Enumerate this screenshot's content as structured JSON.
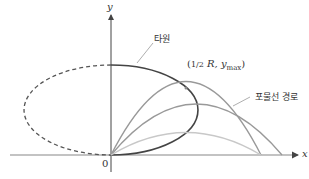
{
  "labels": {
    "y_axis": "y",
    "x_axis": "x",
    "origin": "0",
    "ellipse": "타원",
    "parabola": "포물선 경로",
    "point_frac": "1/2",
    "point_R": "R,",
    "point_y": "y",
    "point_sub": "max"
  },
  "colors": {
    "axis": "#555555",
    "ellipse": "#444444",
    "parabola_dark": "#999999",
    "parabola_light": "#c8c8c8"
  }
}
